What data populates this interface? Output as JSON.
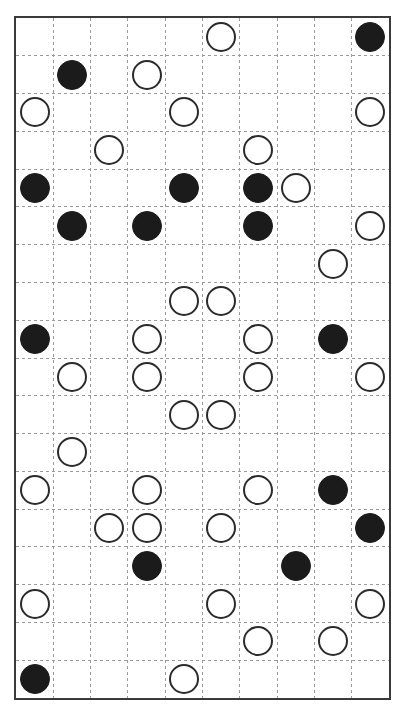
{
  "board": {
    "title": "Stone Placement Grid",
    "frame": {
      "x": 14,
      "y": 16,
      "width": 377,
      "height": 684,
      "border_color": "#3a3a3a",
      "border_width": 2,
      "background": "#ffffff"
    },
    "grid": {
      "columns": 10,
      "rows": 18,
      "cell_width": 37.7,
      "cell_height": 38,
      "line_color": "#9a9a9a",
      "line_style": "dashed",
      "line_width": 1
    },
    "stone_style": {
      "diameter": 30,
      "black_fill": "#1b1b1b",
      "white_fill": "#ffffff",
      "white_stroke": "#2b2b2b"
    },
    "legend": {
      "black_label": "black stone",
      "white_label": "white stone"
    },
    "counts": {
      "black": 19,
      "white": 36,
      "total": 55
    },
    "stones": [
      {
        "col": 6,
        "row": 1,
        "color": "white"
      },
      {
        "col": 10,
        "row": 1,
        "color": "black"
      },
      {
        "col": 2,
        "row": 2,
        "color": "black"
      },
      {
        "col": 4,
        "row": 2,
        "color": "white"
      },
      {
        "col": 1,
        "row": 3,
        "color": "white"
      },
      {
        "col": 5,
        "row": 3,
        "color": "white"
      },
      {
        "col": 10,
        "row": 3,
        "color": "white"
      },
      {
        "col": 3,
        "row": 4,
        "color": "white"
      },
      {
        "col": 7,
        "row": 4,
        "color": "white"
      },
      {
        "col": 1,
        "row": 5,
        "color": "black"
      },
      {
        "col": 5,
        "row": 5,
        "color": "black"
      },
      {
        "col": 7,
        "row": 5,
        "color": "black"
      },
      {
        "col": 8,
        "row": 5,
        "color": "white"
      },
      {
        "col": 2,
        "row": 6,
        "color": "black"
      },
      {
        "col": 4,
        "row": 6,
        "color": "black"
      },
      {
        "col": 7,
        "row": 6,
        "color": "black"
      },
      {
        "col": 10,
        "row": 6,
        "color": "white"
      },
      {
        "col": 9,
        "row": 7,
        "color": "white"
      },
      {
        "col": 5,
        "row": 8,
        "color": "white"
      },
      {
        "col": 6,
        "row": 8,
        "color": "white"
      },
      {
        "col": 1,
        "row": 9,
        "color": "black"
      },
      {
        "col": 4,
        "row": 9,
        "color": "white"
      },
      {
        "col": 7,
        "row": 9,
        "color": "white"
      },
      {
        "col": 9,
        "row": 9,
        "color": "black"
      },
      {
        "col": 2,
        "row": 10,
        "color": "white"
      },
      {
        "col": 4,
        "row": 10,
        "color": "white"
      },
      {
        "col": 7,
        "row": 10,
        "color": "white"
      },
      {
        "col": 10,
        "row": 10,
        "color": "white"
      },
      {
        "col": 5,
        "row": 11,
        "color": "white"
      },
      {
        "col": 6,
        "row": 11,
        "color": "white"
      },
      {
        "col": 2,
        "row": 12,
        "color": "white"
      },
      {
        "col": 1,
        "row": 13,
        "color": "white"
      },
      {
        "col": 4,
        "row": 13,
        "color": "white"
      },
      {
        "col": 7,
        "row": 13,
        "color": "white"
      },
      {
        "col": 9,
        "row": 13,
        "color": "black"
      },
      {
        "col": 3,
        "row": 14,
        "color": "white"
      },
      {
        "col": 4,
        "row": 14,
        "color": "white"
      },
      {
        "col": 6,
        "row": 14,
        "color": "white"
      },
      {
        "col": 10,
        "row": 14,
        "color": "black"
      },
      {
        "col": 4,
        "row": 15,
        "color": "black"
      },
      {
        "col": 8,
        "row": 15,
        "color": "black"
      },
      {
        "col": 1,
        "row": 16,
        "color": "white"
      },
      {
        "col": 6,
        "row": 16,
        "color": "white"
      },
      {
        "col": 10,
        "row": 16,
        "color": "white"
      },
      {
        "col": 7,
        "row": 17,
        "color": "white"
      },
      {
        "col": 9,
        "row": 17,
        "color": "white"
      },
      {
        "col": 1,
        "row": 18,
        "color": "black"
      },
      {
        "col": 5,
        "row": 18,
        "color": "white"
      }
    ]
  }
}
